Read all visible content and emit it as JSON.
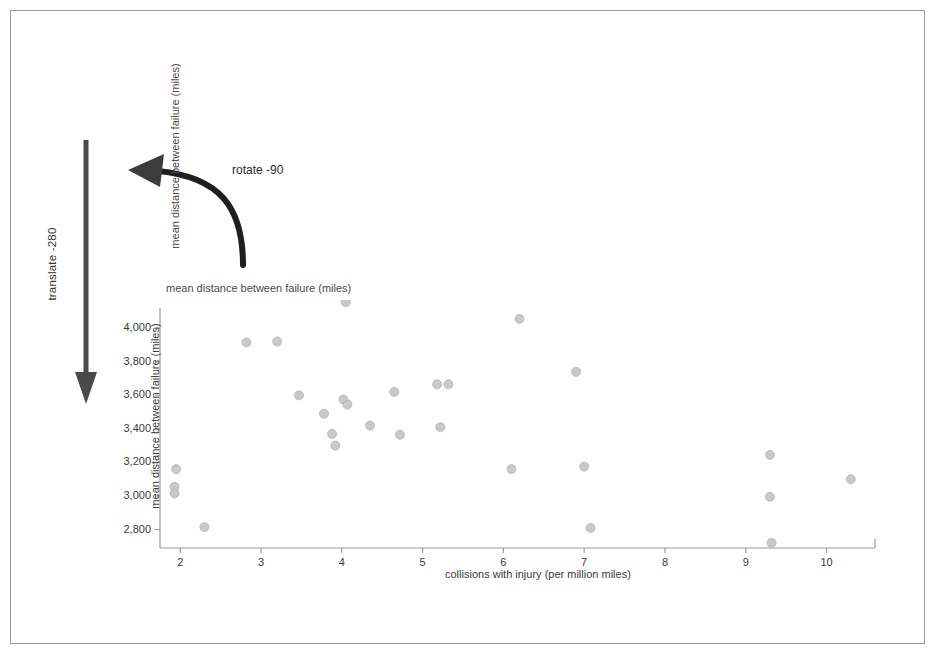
{
  "page": {
    "background_color": "#ffffff",
    "frame_color": "#9a9a9a"
  },
  "annotations": {
    "translate": {
      "label": "translate -280",
      "arrow": "down-arrow",
      "color": "#4a4a4a"
    },
    "rotate": {
      "label": "rotate -90",
      "arrow": "curved-left-arrow",
      "color": "#2b2b2b"
    }
  },
  "ghost_labels": {
    "vertical": "mean distance between failure (miles)",
    "horizontal": "mean distance between failure (miles)"
  },
  "chart_data": {
    "type": "scatter",
    "title": "",
    "xlabel": "collisions with injury (per million miles)",
    "ylabel": "mean distance between failure (miles)",
    "xlim": [
      1.75,
      10.6
    ],
    "ylim": [
      2690,
      4120
    ],
    "xticks": [
      2,
      3,
      4,
      5,
      6,
      7,
      8,
      9,
      10
    ],
    "xtick_labels": [
      "2",
      "3",
      "4",
      "5",
      "6",
      "7",
      "8",
      "9",
      "10"
    ],
    "yticks": [
      2800,
      3000,
      3200,
      3400,
      3600,
      3800,
      4000
    ],
    "ytick_labels": [
      "2,800",
      "3,000",
      "3,200",
      "3,400",
      "3,600",
      "3,800",
      "4,000"
    ],
    "grid": false,
    "legend": null,
    "marker": {
      "shape": "circle",
      "color": "#c9c9c9",
      "edge_color": "#b4b4b4",
      "size": 9
    },
    "points": [
      {
        "x": 1.95,
        "y": 3160
      },
      {
        "x": 1.93,
        "y": 3055
      },
      {
        "x": 1.93,
        "y": 3015
      },
      {
        "x": 2.3,
        "y": 2815
      },
      {
        "x": 2.82,
        "y": 3915
      },
      {
        "x": 3.2,
        "y": 3920
      },
      {
        "x": 3.47,
        "y": 3600
      },
      {
        "x": 3.78,
        "y": 3490
      },
      {
        "x": 3.88,
        "y": 3370
      },
      {
        "x": 3.92,
        "y": 3300
      },
      {
        "x": 4.05,
        "y": 4155
      },
      {
        "x": 4.02,
        "y": 3575
      },
      {
        "x": 4.07,
        "y": 3545
      },
      {
        "x": 4.35,
        "y": 3420
      },
      {
        "x": 4.65,
        "y": 3620
      },
      {
        "x": 4.72,
        "y": 3365
      },
      {
        "x": 5.18,
        "y": 3665
      },
      {
        "x": 5.32,
        "y": 3665
      },
      {
        "x": 5.22,
        "y": 3410
      },
      {
        "x": 6.1,
        "y": 3160
      },
      {
        "x": 6.2,
        "y": 4055
      },
      {
        "x": 6.9,
        "y": 3740
      },
      {
        "x": 7.0,
        "y": 3175
      },
      {
        "x": 7.08,
        "y": 2810
      },
      {
        "x": 9.3,
        "y": 3245
      },
      {
        "x": 9.3,
        "y": 2995
      },
      {
        "x": 9.32,
        "y": 2720
      },
      {
        "x": 10.3,
        "y": 3100
      }
    ]
  }
}
